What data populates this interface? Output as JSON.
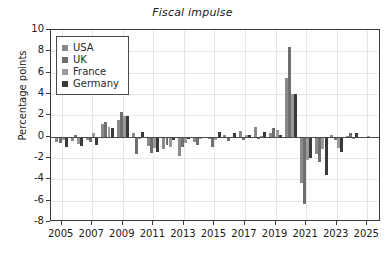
{
  "chart_data": {
    "type": "bar",
    "title": "Fiscal impulse",
    "xlabel": "",
    "ylabel": "Percentage points",
    "ylim": [
      -8,
      10
    ],
    "ytick_values": [
      10,
      8,
      6,
      4,
      2,
      0,
      -2,
      -4,
      -6,
      -8
    ],
    "ytick_labels": [
      "10",
      "8",
      "6",
      "4",
      "2",
      "0",
      "-2",
      "-4",
      "-6",
      "-8"
    ],
    "xlim": [
      2004.3,
      2025.9
    ],
    "xtick_labels": [
      "2005",
      "2007",
      "2009",
      "2011",
      "2013",
      "2015",
      "2017",
      "2019",
      "2021",
      "2023",
      "2025"
    ],
    "xtick_values": [
      2005,
      2007,
      2009,
      2011,
      2013,
      2015,
      2017,
      2019,
      2021,
      2023,
      2025
    ],
    "grid": true,
    "legend_position": "upper left",
    "categories": [
      2005,
      2006,
      2007,
      2008,
      2009,
      2010,
      2011,
      2012,
      2013,
      2014,
      2015,
      2016,
      2017,
      2018,
      2019,
      2020,
      2021,
      2022,
      2023,
      2024,
      2025
    ],
    "series": [
      {
        "name": "USA",
        "color": "#8a8a8a",
        "values": [
          -0.5,
          -0.4,
          -0.3,
          1.2,
          1.6,
          0.3,
          -0.9,
          -1.2,
          -1.8,
          -0.5,
          -0.2,
          0.2,
          0.5,
          0.9,
          0.3,
          5.5,
          -4.3,
          -1.6,
          0.2,
          0.1,
          -0.1
        ]
      },
      {
        "name": "UK",
        "color": "#6f6f6f",
        "values": [
          -0.6,
          0.2,
          -0.5,
          1.4,
          2.3,
          -1.6,
          -1.5,
          -0.8,
          -1.0,
          -0.8,
          -1.0,
          -0.4,
          -0.3,
          -0.2,
          0.8,
          8.4,
          -6.3,
          -2.4,
          -0.3,
          0.3,
          0.0
        ]
      },
      {
        "name": "France",
        "color": "#9a9a9a",
        "values": [
          -0.3,
          -0.7,
          0.3,
          0.9,
          1.9,
          -0.2,
          -1.1,
          -1.0,
          -0.6,
          -0.2,
          -0.3,
          -0.1,
          0.2,
          0.1,
          0.6,
          4.0,
          -2.2,
          -1.2,
          -1.1,
          -0.2,
          0.1
        ]
      },
      {
        "name": "Germany",
        "color": "#3a3a3a",
        "values": [
          -1.0,
          -0.9,
          -0.8,
          0.8,
          1.9,
          0.4,
          -1.4,
          -0.3,
          -0.2,
          -0.1,
          0.4,
          0.3,
          0.2,
          0.4,
          0.2,
          4.0,
          -2.0,
          -3.6,
          -1.4,
          0.3,
          0.0
        ]
      }
    ],
    "legend": [
      {
        "label": "USA",
        "color": "#8a8a8a"
      },
      {
        "label": "UK",
        "color": "#6f6f6f"
      },
      {
        "label": "France",
        "color": "#9a9a9a"
      },
      {
        "label": "Germany",
        "color": "#3a3a3a"
      }
    ]
  }
}
